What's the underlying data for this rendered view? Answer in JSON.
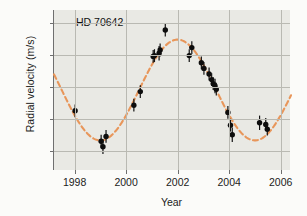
{
  "figure": {
    "annotation": "HD 70642",
    "background_color": "#e9e9e4",
    "curve_color": "#e8965a",
    "point_color": "#0d0d0d"
  },
  "chart_data": {
    "type": "scatter",
    "title": "HD 70642",
    "xlabel": "Year",
    "ylabel": "Radial velocity (m/s)",
    "xlim": [
      1997.2,
      2006.4
    ],
    "ylim": [
      -52,
      48
    ],
    "xticks": [
      1998,
      2000,
      2002,
      2004,
      2006
    ],
    "xtick_labels": [
      "1998",
      "2000",
      "2002",
      "2004",
      "2006"
    ],
    "yticks": [
      40,
      20,
      0,
      -20,
      -40
    ],
    "ytick_labels": [
      "40",
      "20",
      "0",
      "-20",
      "-40"
    ],
    "grid": true,
    "legend": "none",
    "series": [
      {
        "name": "Radial velocity measurements",
        "marker": "filled-circle-with-errorbars",
        "points": [
          {
            "x": 1998.02,
            "y": -15.0,
            "yerr": 4.0
          },
          {
            "x": 1999.03,
            "y": -34.0,
            "yerr": 4.0
          },
          {
            "x": 1999.1,
            "y": -37.5,
            "yerr": 4.5
          },
          {
            "x": 1999.22,
            "y": -31.0,
            "yerr": 4.0
          },
          {
            "x": 2000.3,
            "y": -11.5,
            "yerr": 4.0
          },
          {
            "x": 2000.55,
            "y": -3.0,
            "yerr": 4.0
          },
          {
            "x": 2001.05,
            "y": 19.0,
            "yerr": 4.0
          },
          {
            "x": 2001.1,
            "y": 19.5,
            "yerr": 4.0
          },
          {
            "x": 2001.28,
            "y": 21.0,
            "yerr": 4.5
          },
          {
            "x": 2001.32,
            "y": 23.0,
            "yerr": 4.0
          },
          {
            "x": 2001.52,
            "y": 35.5,
            "yerr": 4.0
          },
          {
            "x": 2002.45,
            "y": 19.5,
            "yerr": 4.0
          },
          {
            "x": 2002.55,
            "y": 24.5,
            "yerr": 4.0
          },
          {
            "x": 2002.92,
            "y": 15.0,
            "yerr": 4.0
          },
          {
            "x": 2003.02,
            "y": 11.5,
            "yerr": 4.0
          },
          {
            "x": 2003.22,
            "y": 8.0,
            "yerr": 4.0
          },
          {
            "x": 2003.32,
            "y": 4.5,
            "yerr": 4.0
          },
          {
            "x": 2003.38,
            "y": 2.0,
            "yerr": 4.0
          },
          {
            "x": 2003.45,
            "y": 0.5,
            "yerr": 4.5
          },
          {
            "x": 2003.5,
            "y": -1.5,
            "yerr": 4.0
          },
          {
            "x": 2003.95,
            "y": -16.0,
            "yerr": 4.0
          },
          {
            "x": 2004.05,
            "y": -24.0,
            "yerr": 4.0
          },
          {
            "x": 2004.12,
            "y": -30.0,
            "yerr": 4.5
          },
          {
            "x": 2005.18,
            "y": -22.5,
            "yerr": 4.5
          },
          {
            "x": 2005.42,
            "y": -23.5,
            "yerr": 4.0
          },
          {
            "x": 2005.48,
            "y": -26.5,
            "yerr": 4.0
          }
        ]
      }
    ],
    "fit_curve": {
      "name": "Keplerian orbit fit",
      "style": "dashed",
      "color": "#e8965a",
      "amplitude": 31.5,
      "period_years": 6.0,
      "offset": -2.0,
      "phase_peak_year": 2002.0
    }
  }
}
